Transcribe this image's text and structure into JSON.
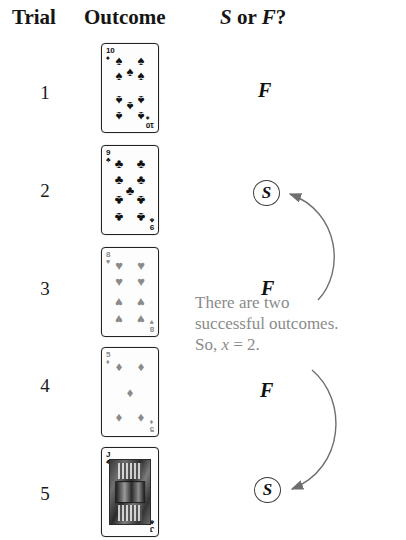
{
  "header": {
    "trial": "Trial",
    "outcome": "Outcome",
    "sf_prefix": "S",
    "sf_middle": " or ",
    "sf_suffix": "F",
    "sf_question": "?"
  },
  "rows": [
    {
      "trial": "1",
      "card": {
        "rank": "10",
        "suit": "spade",
        "glyph": "♠",
        "color": "#111111",
        "type": "pip",
        "count": 10
      },
      "result": "F",
      "result_circled": false
    },
    {
      "trial": "2",
      "card": {
        "rank": "9",
        "suit": "club",
        "glyph": "♣",
        "color": "#111111",
        "type": "pip",
        "count": 9
      },
      "result": "S",
      "result_circled": true
    },
    {
      "trial": "3",
      "card": {
        "rank": "8",
        "suit": "heart",
        "glyph": "♥",
        "color": "#8a8a8a",
        "type": "pip",
        "count": 8
      },
      "result": "F",
      "result_circled": false
    },
    {
      "trial": "4",
      "card": {
        "rank": "5",
        "suit": "diamond",
        "glyph": "♦",
        "color": "#8a8a8a",
        "type": "pip",
        "count": 5
      },
      "result": "F",
      "result_circled": false
    },
    {
      "trial": "5",
      "card": {
        "rank": "J",
        "suit": "club",
        "glyph": "♣",
        "color": "#111111",
        "type": "face",
        "count": 0
      },
      "result": "S",
      "result_circled": true
    }
  ],
  "annotation": {
    "line1": "There are two",
    "line2": "successful outcomes.",
    "line3_prefix": "So, ",
    "line3_var": "x",
    "line3_suffix": " = 2."
  },
  "colors": {
    "ink": "#111111",
    "annotation_gray": "#8b8b8b",
    "card_border": "#222222",
    "arrow": "#6f6f6f"
  },
  "chart_data": {
    "type": "table",
    "columns": [
      "Trial",
      "Outcome",
      "S or F?"
    ],
    "rows": [
      [
        "1",
        "10 of spades",
        "F"
      ],
      [
        "2",
        "9 of clubs",
        "S"
      ],
      [
        "3",
        "8 of hearts",
        "F"
      ],
      [
        "4",
        "5 of diamonds",
        "F"
      ],
      [
        "5",
        "Jack of clubs",
        "S"
      ]
    ],
    "successes": 2,
    "trials": 5,
    "note": "There are two successful outcomes. So, x = 2."
  }
}
